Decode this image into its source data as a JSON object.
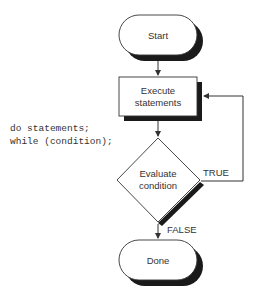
{
  "code": {
    "lines": [
      "do statements;",
      "while (condition);"
    ]
  },
  "nodes": {
    "start": {
      "type": "terminal",
      "label": "Start"
    },
    "execute": {
      "type": "process",
      "label_lines": [
        "Execute",
        "statements"
      ]
    },
    "evaluate": {
      "type": "decision",
      "label_lines": [
        "Evaluate",
        "condition"
      ]
    },
    "done": {
      "type": "terminal",
      "label": "Done"
    }
  },
  "edges": {
    "start_to_execute": {
      "from": "start",
      "to": "execute",
      "label": ""
    },
    "execute_to_evaluate": {
      "from": "execute",
      "to": "evaluate",
      "label": ""
    },
    "true_loop": {
      "from": "evaluate",
      "to": "execute",
      "label": "TRUE"
    },
    "false_exit": {
      "from": "evaluate",
      "to": "done",
      "label": "FALSE"
    }
  },
  "colors": {
    "stroke": "#333333",
    "shadow": "#1a1a1a",
    "fill": "#ffffff",
    "text": "#333333"
  }
}
